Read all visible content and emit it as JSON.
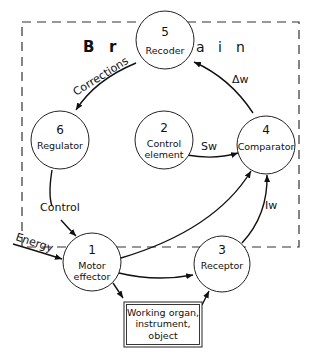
{
  "diagram": {
    "region_label": {
      "letters": [
        "B",
        "r",
        "a",
        "i",
        "n"
      ],
      "text": "Brain"
    },
    "nodes": [
      {
        "id": "1",
        "number": "1",
        "lines": [
          "Motor",
          "effector"
        ]
      },
      {
        "id": "2",
        "number": "2",
        "lines": [
          "Control",
          "element"
        ]
      },
      {
        "id": "3",
        "number": "3",
        "lines": [
          "Receptor"
        ]
      },
      {
        "id": "4",
        "number": "4",
        "lines": [
          "Comparator"
        ]
      },
      {
        "id": "5",
        "number": "5",
        "lines": [
          "Recoder"
        ]
      },
      {
        "id": "6",
        "number": "6",
        "lines": [
          "Regulator"
        ]
      }
    ],
    "box": {
      "lines": [
        "Working organ,",
        "instrument,",
        "object"
      ]
    },
    "edges": [
      {
        "from": "5",
        "to": "6",
        "label": "Corrections"
      },
      {
        "from": "4",
        "to": "5",
        "label": "Δw"
      },
      {
        "from": "2",
        "to": "4",
        "label": "Sw"
      },
      {
        "from": "6",
        "to": "1",
        "label": "Control"
      },
      {
        "from": "external",
        "to": "1",
        "label": "Energy"
      },
      {
        "from": "1",
        "to": "4",
        "label": ""
      },
      {
        "from": "1",
        "to": "3",
        "label": ""
      },
      {
        "from": "1",
        "to": "box",
        "label": ""
      },
      {
        "from": "box",
        "to": "3",
        "label": ""
      },
      {
        "from": "3",
        "to": "4",
        "label": "Iw"
      }
    ]
  }
}
